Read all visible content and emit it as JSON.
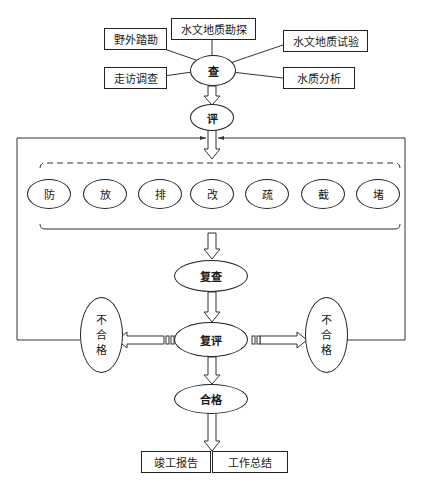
{
  "investigate": {
    "center": "查",
    "inputs": [
      "野外踏勘",
      "水文地质勘探",
      "水文地质试验",
      "走访调查",
      "水质分析"
    ]
  },
  "evaluate": "评",
  "measures": [
    "防",
    "放",
    "排",
    "改",
    "疏",
    "截",
    "堵"
  ],
  "recheck": "复查",
  "reevaluate": "复评",
  "fail_left": [
    "不",
    "合",
    "格"
  ],
  "fail_right": [
    "不",
    "合",
    "格"
  ],
  "pass": "合格",
  "outputs": [
    "竣工报告",
    "工作总结"
  ]
}
